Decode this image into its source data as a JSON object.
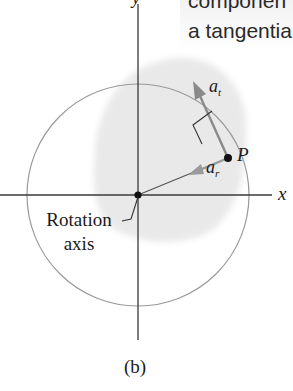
{
  "diagram": {
    "top_text_lines": [
      "componen",
      "a tangentia"
    ],
    "axis_labels": {
      "x": "x",
      "y": "y"
    },
    "point_label": "P",
    "vectors": [
      {
        "name": "tangential-acceleration",
        "symbol": "a",
        "subscript": "t"
      },
      {
        "name": "radial-acceleration",
        "symbol": "a",
        "subscript": "r"
      }
    ],
    "rotation_axis_label": [
      "Rotation",
      "axis"
    ],
    "panel_label": "(b)",
    "colors": {
      "axis": "#3a3a3a",
      "circle": "#9a9a9a",
      "shade": "#ececec",
      "vector": "#8a8a8a",
      "point": "#111111"
    }
  }
}
